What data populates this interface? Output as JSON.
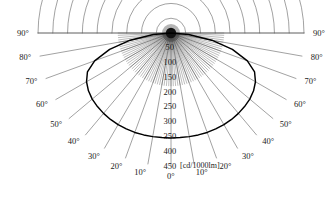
{
  "figure": {
    "type": "polar-light-distribution-diagram",
    "unit_label": "[cd/1000lm]",
    "center": {
      "x": 171,
      "y": 33
    },
    "grid": {
      "outer_radius_px": 133,
      "ring_step_value": 50,
      "ring_step_px": 14.78,
      "spoke_step_deg": 10,
      "grid_color": "#555555",
      "curve_color": "#000000",
      "background": "#ffffff"
    },
    "angle_labels_left": [
      "90°",
      "80°",
      "70°",
      "60°",
      "50°",
      "40°",
      "30°",
      "20°",
      "10°"
    ],
    "angle_labels_right": [
      "90°",
      "80°",
      "70°",
      "60°",
      "50°",
      "40°",
      "30°",
      "20°",
      "10°"
    ],
    "angle_label_center": "0°",
    "radial_labels": [
      "50",
      "100",
      "150",
      "200",
      "250",
      "300",
      "350",
      "400",
      "450"
    ]
  },
  "chart_data": {
    "type": "line",
    "title": "",
    "subtitle": "",
    "xlabel": "",
    "ylabel": "",
    "units": "cd/1000lm",
    "coordinate_system": "polar",
    "angle_unit": "degrees",
    "angle_range": [
      -90,
      90
    ],
    "radial_range": [
      0,
      450
    ],
    "radial_ticks": [
      50,
      100,
      150,
      200,
      250,
      300,
      350,
      400,
      450
    ],
    "radial_tick_labels": [
      "50",
      "100",
      "150",
      "200",
      "250",
      "300",
      "350",
      "400",
      "450"
    ],
    "angle_ticks": [
      -90,
      -80,
      -70,
      -60,
      -50,
      -40,
      -30,
      -20,
      -10,
      0,
      10,
      20,
      30,
      40,
      50,
      60,
      70,
      80,
      90
    ],
    "angle_tick_labels": [
      "90°",
      "80°",
      "70°",
      "60°",
      "50°",
      "40°",
      "30°",
      "20°",
      "10°",
      "0°",
      "10°",
      "20°",
      "30°",
      "40°",
      "50°",
      "60°",
      "70°",
      "80°",
      "90°"
    ],
    "grid": true,
    "legend": false,
    "series": [
      {
        "name": "luminous intensity",
        "angles": [
          -90,
          -85,
          -80,
          -75,
          -70,
          -65,
          -60,
          -55,
          -50,
          -45,
          -40,
          -35,
          -30,
          -25,
          -20,
          -15,
          -10,
          -5,
          0,
          5,
          10,
          15,
          20,
          25,
          30,
          35,
          40,
          45,
          50,
          55,
          60,
          65,
          70,
          75,
          80,
          85,
          90
        ],
        "values": [
          0,
          60,
          140,
          215,
          275,
          312,
          330,
          341,
          348,
          352,
          355,
          357,
          358,
          358,
          358,
          357,
          356,
          355,
          355,
          355,
          356,
          357,
          358,
          358,
          358,
          357,
          355,
          352,
          348,
          341,
          330,
          312,
          275,
          215,
          140,
          60,
          0
        ]
      }
    ]
  }
}
